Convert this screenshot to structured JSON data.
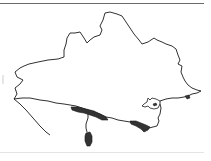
{
  "map": {
    "subject": "county outline map",
    "outline_color": "#1a1a1a",
    "fill_color": "#ffffff",
    "shaded_color": "#333333",
    "shaded_areas": [
      "western coastal strip",
      "peninsula (Portland)",
      "south-east coastal strip",
      "harbour island",
      "eastern coastal point"
    ]
  }
}
